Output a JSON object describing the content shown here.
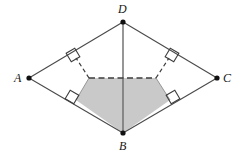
{
  "figure": {
    "name": "quadrilateral-abcd-with-shaded-pentagon",
    "width": 244,
    "height": 159,
    "background_color": "#ffffff",
    "stroke_color": "#4a4a4a",
    "dashed_color": "#3c3c3c",
    "shade_fill": "#c9c9c9",
    "dot_color": "#111111",
    "labels": {
      "A": "A",
      "B": "B",
      "C": "C",
      "D": "D"
    },
    "vertices": {
      "A": {
        "x": 29,
        "y": 78
      },
      "B": {
        "x": 123,
        "y": 133
      },
      "C": {
        "x": 217,
        "y": 78
      },
      "D": {
        "x": 123,
        "y": 22
      }
    },
    "diagonal": {
      "from": "D",
      "to": "B"
    },
    "edges": [
      {
        "from": "A",
        "to": "D"
      },
      {
        "from": "D",
        "to": "C"
      },
      {
        "from": "C",
        "to": "B"
      },
      {
        "from": "B",
        "to": "A"
      }
    ],
    "shaded_region": {
      "type": "pentagon",
      "points": [
        {
          "x": 89,
          "y": 78
        },
        {
          "x": 156,
          "y": 78
        },
        {
          "x": 170,
          "y": 100
        },
        {
          "x": 123,
          "y": 133
        },
        {
          "x": 76,
          "y": 100
        }
      ]
    },
    "dashed_segments": [
      {
        "from": {
          "x": 89,
          "y": 78
        },
        "to": {
          "x": 156,
          "y": 78
        }
      },
      {
        "from": {
          "x": 89,
          "y": 78
        },
        "to": {
          "x": 76,
          "y": 58
        }
      },
      {
        "from": {
          "x": 156,
          "y": 78
        },
        "to": {
          "x": 169,
          "y": 58
        }
      }
    ],
    "right_angle_marks": [
      {
        "id": "upper-left",
        "cx": 73,
        "cy": 55
      },
      {
        "id": "upper-right",
        "cx": 172,
        "cy": 55
      },
      {
        "id": "lower-left",
        "cx": 72,
        "cy": 97
      },
      {
        "id": "lower-right",
        "cx": 173,
        "cy": 97
      }
    ]
  }
}
